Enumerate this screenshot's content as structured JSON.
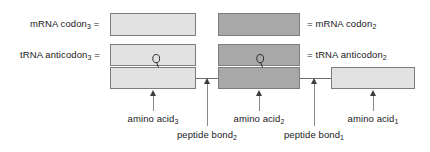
{
  "figure": {
    "colors": {
      "light_fill": "#e2e2e2",
      "dark_fill": "#a8a8a8",
      "box_border": "#7d7d7d",
      "line": "#6e6e6e",
      "arrow": "#3d3d3d",
      "text": "#1a1a1a"
    }
  },
  "labels": {
    "mrna_codon_3": {
      "text": "mRNA codon",
      "sub": "3",
      "equals": "="
    },
    "trna_anticodon_3": {
      "text": "tRNA anticodon",
      "sub": "3",
      "equals": "="
    },
    "mrna_codon_2": {
      "equals": "=",
      "text": "mRNA codon",
      "sub": "2"
    },
    "trna_anticodon_2": {
      "equals": "=",
      "text": "tRNA anticodon",
      "sub": "2"
    },
    "amino_acid_3": {
      "text": "amino acid",
      "sub": "3"
    },
    "amino_acid_2": {
      "text": "amino acid",
      "sub": "2"
    },
    "amino_acid_1": {
      "text": "amino acid",
      "sub": "1"
    },
    "peptide_bond_2": {
      "text": "peptide bond",
      "sub": "2"
    },
    "peptide_bond_1": {
      "text": "peptide bond",
      "sub": "1"
    }
  },
  "rows": [
    {
      "name": "mrna-codon-row",
      "boxes": [
        {
          "name": "mrna-codon-3-box",
          "shade": "light"
        },
        {
          "name": "mrna-codon-2-box",
          "shade": "dark"
        }
      ]
    },
    {
      "name": "trna-anticodon-row",
      "boxes": [
        {
          "name": "trna-anticodon-3-box",
          "shade": "light"
        },
        {
          "name": "trna-anticodon-2-box",
          "shade": "dark"
        }
      ]
    },
    {
      "name": "amino-acid-row",
      "boxes": [
        {
          "name": "amino-acid-3-box",
          "shade": "light"
        },
        {
          "name": "amino-acid-2-box",
          "shade": "dark"
        },
        {
          "name": "amino-acid-1-box",
          "shade": "light"
        }
      ]
    }
  ]
}
